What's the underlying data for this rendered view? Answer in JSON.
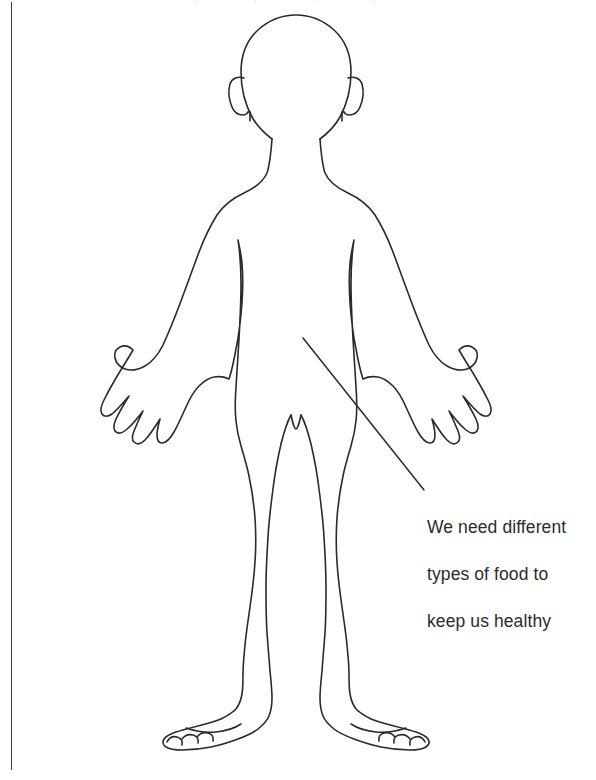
{
  "page": {
    "background_color": "#ffffff",
    "width": 596,
    "height": 780
  },
  "margin_rule": {
    "name": "left-margin-rule",
    "color": "#3a3a3a",
    "orientation": "vertical"
  },
  "figure": {
    "name": "child-body-outline",
    "stroke_color": "#2a2a2a",
    "fill_color": "none",
    "stroke_width": 1.6,
    "parts": [
      "head",
      "ears",
      "neck",
      "shoulders",
      "left-arm",
      "right-arm",
      "left-hand",
      "right-hand",
      "torso",
      "left-leg",
      "right-leg",
      "left-foot",
      "right-foot"
    ]
  },
  "annotation": {
    "name": "food-health-annotation",
    "text": "We need different\ntypes of food to\nkeep us healthy",
    "lines": [
      "We need different",
      "types of food to",
      "keep us healthy"
    ],
    "text_color": "#2b2b2b",
    "leader_line": {
      "name": "annotation-leader-line",
      "color": "#2a2a2a",
      "from_x": 303,
      "from_y": 338,
      "to_x": 424,
      "to_y": 490
    }
  },
  "top_crop": {
    "text": "· · · ·"
  }
}
